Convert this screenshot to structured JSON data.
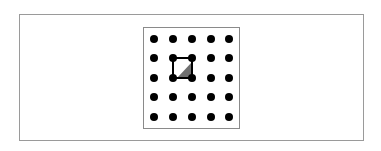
{
  "figure": {
    "grid": {
      "rows": 5,
      "cols": 5,
      "dot_color": "#000000",
      "x": [
        154,
        173,
        192,
        211,
        229
      ],
      "y": [
        39,
        58,
        78,
        97,
        117
      ]
    },
    "square": {
      "row_start": 1,
      "col_start": 1,
      "row_end": 2,
      "col_end": 2,
      "stroke": "#000000"
    },
    "shaded_triangle": {
      "points": [
        [
          177,
          78
        ],
        [
          192,
          62
        ],
        [
          192,
          78
        ]
      ],
      "fill": "#707070"
    },
    "colors": {
      "outer_border": "#9a9a9a",
      "inner_border": "#8a8a8a",
      "background": "#ffffff"
    }
  }
}
